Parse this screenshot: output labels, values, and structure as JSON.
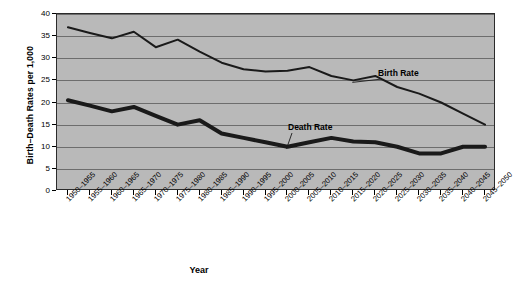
{
  "chart_data": {
    "type": "line",
    "title": "",
    "xlabel": "Year",
    "ylabel": "Birth–Death Rates per 1,000",
    "ylim": [
      0,
      40
    ],
    "yticks": [
      0,
      5,
      10,
      15,
      20,
      25,
      30,
      35,
      40
    ],
    "grid": true,
    "legend": "none",
    "annotations": [
      {
        "text": "Birth Rate",
        "series": "Birth Rate",
        "category": "2010-2015"
      },
      {
        "text": "Death Rate",
        "series": "Death Rate",
        "category": "2000-2005"
      }
    ],
    "categories": [
      "1950–1955",
      "1955–1960",
      "1960–1965",
      "1965–1970",
      "1970–1975",
      "1975–1980",
      "1980–1985",
      "1985–1990",
      "1990–1995",
      "1995–2000",
      "2000–2005",
      "2005–2010",
      "2010–2015",
      "2015–2020",
      "2020–2025",
      "2025–2030",
      "2030–2035",
      "2035–2040",
      "2040–2045",
      "2045–2050"
    ],
    "series": [
      {
        "name": "Birth Rate",
        "color": "#1a1a1a",
        "width": 2,
        "values": [
          37.0,
          35.7,
          34.5,
          36.0,
          32.5,
          34.2,
          31.5,
          29.0,
          27.5,
          27.0,
          27.2,
          28.0,
          26.0,
          25.0,
          26.0,
          23.5,
          22.0,
          20.0,
          17.5,
          15.0
        ]
      },
      {
        "name": "Death Rate",
        "color": "#1a1a1a",
        "width": 4,
        "values": [
          20.5,
          19.3,
          18.0,
          19.0,
          17.0,
          15.0,
          16.0,
          13.0,
          12.0,
          11.0,
          10.0,
          11.0,
          12.0,
          11.2,
          11.0,
          10.0,
          8.5,
          8.5,
          10.0,
          10.0
        ]
      }
    ]
  },
  "axes": {
    "y_title": "Birth–Death Rates per 1,000",
    "x_title": "Year"
  }
}
